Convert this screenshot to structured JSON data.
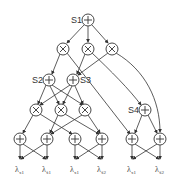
{
  "diagram": {
    "type": "sum-product network",
    "nodes": [
      {
        "id": "S1",
        "label": "S1",
        "op": "+",
        "x": 88,
        "y": 20,
        "label_side": "left"
      },
      {
        "id": "P1",
        "label": "",
        "op": "×",
        "x": 63,
        "y": 49
      },
      {
        "id": "P2",
        "label": "",
        "op": "×",
        "x": 88,
        "y": 49
      },
      {
        "id": "P3",
        "label": "",
        "op": "×",
        "x": 112,
        "y": 49
      },
      {
        "id": "S2",
        "label": "S2",
        "op": "+",
        "x": 49,
        "y": 80,
        "label_side": "left"
      },
      {
        "id": "S3",
        "label": "S3",
        "op": "+",
        "x": 73,
        "y": 80,
        "label_side": "right"
      },
      {
        "id": "P4",
        "label": "",
        "op": "×",
        "x": 36,
        "y": 110
      },
      {
        "id": "P5",
        "label": "",
        "op": "×",
        "x": 61,
        "y": 110
      },
      {
        "id": "P6",
        "label": "",
        "op": "×",
        "x": 85,
        "y": 110
      },
      {
        "id": "S4",
        "label": "S4",
        "op": "+",
        "x": 145,
        "y": 110,
        "label_side": "left"
      },
      {
        "id": "B1",
        "label": "",
        "op": "+",
        "x": 20,
        "y": 139
      },
      {
        "id": "B2",
        "label": "",
        "op": "+",
        "x": 47,
        "y": 139
      },
      {
        "id": "B3",
        "label": "",
        "op": "+",
        "x": 75,
        "y": 139
      },
      {
        "id": "B4",
        "label": "",
        "op": "+",
        "x": 102,
        "y": 139
      },
      {
        "id": "B5",
        "label": "",
        "op": "+",
        "x": 132,
        "y": 139
      },
      {
        "id": "B6",
        "label": "",
        "op": "+",
        "x": 160,
        "y": 139
      }
    ],
    "leaves": [
      {
        "id": "L1",
        "symbol": "λ",
        "sub": "x1",
        "x": 20,
        "y": 160
      },
      {
        "id": "L2",
        "symbol": "λ",
        "sub": "x̄1",
        "x": 47,
        "y": 160
      },
      {
        "id": "L3",
        "symbol": "λ",
        "sub": "x1",
        "x": 75,
        "y": 160
      },
      {
        "id": "L4",
        "symbol": "λ",
        "sub": "x̄2",
        "x": 102,
        "y": 160
      },
      {
        "id": "L5",
        "symbol": "λ",
        "sub": "x1",
        "x": 132,
        "y": 160
      },
      {
        "id": "L6",
        "symbol": "λ",
        "sub": "x̄2",
        "x": 160,
        "y": 160
      }
    ],
    "labels": {
      "s1": "S1",
      "s2": "S2",
      "s3": "S3",
      "s4": "S4",
      "leaf_symbol": "λ",
      "leaf1_sub": "x1",
      "leaf2_sub": "x̄1",
      "leaf3_sub": "x1",
      "leaf4_sub": "x̄2",
      "leaf5_sub": "x1",
      "leaf6_sub": "x̄2"
    },
    "colors": {
      "stroke": "#333333",
      "background": "#ffffff"
    }
  }
}
